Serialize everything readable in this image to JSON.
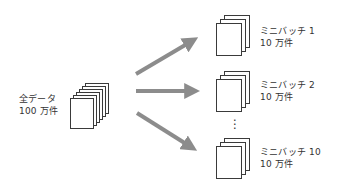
{
  "source": {
    "label_line1": "全データ",
    "label_line2": "100 万件",
    "page_count": 6
  },
  "batches": [
    {
      "name": "ミニバッチ 1",
      "count": "10 万件"
    },
    {
      "name": "ミニバッチ 2",
      "count": "10 万件"
    },
    {
      "name": "ミニバッチ 10",
      "count": "10 万件"
    }
  ],
  "ellipsis": "⋮",
  "colors": {
    "arrow": "#8c8c8c",
    "page_border": "#3a3a3a",
    "text": "#333333"
  }
}
